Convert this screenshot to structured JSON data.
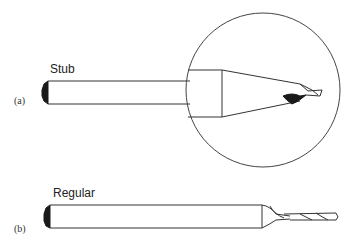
{
  "figure": {
    "panels": [
      {
        "id": "a",
        "panel_label": "(a)",
        "title": "Stub"
      },
      {
        "id": "b",
        "panel_label": "(b)",
        "title": "Regular"
      }
    ],
    "colors": {
      "stroke": "#333333",
      "fill_dark": "#1a1a1a",
      "background": "#ffffff"
    }
  }
}
